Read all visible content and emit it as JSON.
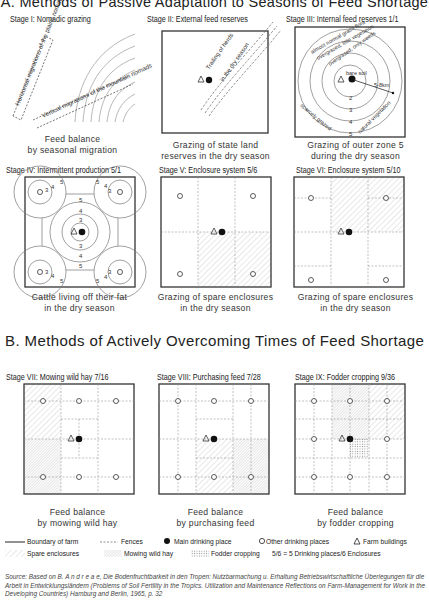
{
  "title": "A. Methods of Passive Adaptation to Seasons of Feed Shortage",
  "section_b_title": "B. Methods of Actively Overcoming Times of Feed Shortage",
  "stages": [
    {
      "id": "I",
      "label": "Stage I: Nomadic grazing",
      "caption": [
        "Feed balance",
        "by seasonal migration"
      ],
      "annotations": [
        "Horizontal migrations of the plains nomads",
        "Vertical migrations of the mountain nomads"
      ]
    },
    {
      "id": "II",
      "label": "Stage II: External feed reserves",
      "caption": [
        "Grazing of state land",
        "reserves in the dry season"
      ],
      "annotations": [
        "Trailing of herds",
        "in the dry season"
      ]
    },
    {
      "id": "III",
      "label": "Stage III: Internal feed reserves 1/1",
      "caption": [
        "Grazing of outer zone 5",
        "during the dry season"
      ],
      "annotations": [
        "bare soil",
        "overgrazed, only weeds",
        "overgrazed, little vegetation",
        "almost normal grass flora",
        "scarcely grazed",
        "natural vegetation",
        "5-8km",
        "2",
        "3",
        "4",
        "5"
      ]
    },
    {
      "id": "IV",
      "label": "Stage IV: Intermittent production 5/1",
      "caption": [
        "Cattle living off their fat",
        "in the dry season"
      ],
      "zone_numbers": [
        "3",
        "4",
        "5"
      ]
    },
    {
      "id": "V",
      "label": "Stage V: Enclosure system 5/6",
      "caption": [
        "Grazing of spare enclosures",
        "in the dry season"
      ]
    },
    {
      "id": "VI",
      "label": "Stage VI: Enclosure system 5/10",
      "caption": [
        "Grazing of spare enclosures",
        "in the dry season"
      ]
    },
    {
      "id": "VII",
      "label": "Stage VII: Mowing wild hay  7/16",
      "caption": [
        "Feed balance",
        "by mowing wild hay"
      ]
    },
    {
      "id": "VIII",
      "label": "Stage VIII: Purchasing feed 7/28",
      "caption": [
        "Feed balance",
        "by purchasing feed"
      ]
    },
    {
      "id": "IX",
      "label": "Stage IX: Fodder cropping 9/36",
      "caption": [
        "Feed balance",
        "by fodder cropping"
      ]
    }
  ],
  "legend": {
    "row1": [
      {
        "icon": "solid-line-icon",
        "label": "Boundary of farm"
      },
      {
        "icon": "dashed-line-icon",
        "label": "Fences"
      },
      {
        "icon": "filled-circle-icon",
        "label": "Main drinking place"
      },
      {
        "icon": "open-circle-icon",
        "label": "Other drinking places"
      },
      {
        "icon": "triangle-icon",
        "label": "Farm buildings"
      }
    ],
    "row2": [
      {
        "icon": "diagonal-hatch-icon",
        "label": "Spare enclosures"
      },
      {
        "icon": "dense-hatch-icon",
        "label": "Mowing wild hay"
      },
      {
        "icon": "cross-hatch-icon",
        "label": "Fodder cropping"
      },
      {
        "icon": "",
        "label": "5/6 = 5 Drinking places/6 Enclosures"
      }
    ]
  },
  "source": "Source: Based on B. A n d r e a e, Die Bodenfruchtbarkeit in den Tropen: Nutzbarmachung u. Erhaltung Betriebswirtschaftliche Überlegungen für die Arbeit in Entwicklungsländern (Problems of Soil Fertility in the Tropics. Utilization and Maintenance Reflections on Farm-Management for Work in the Developing Countries) Hamburg and Berlin, 1965, p. 32"
}
